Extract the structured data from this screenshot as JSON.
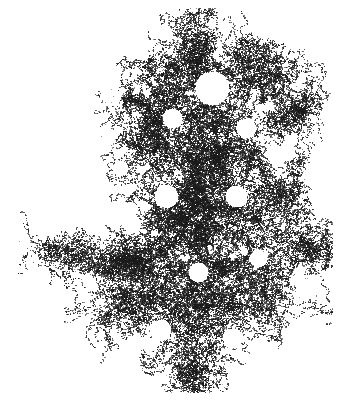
{
  "image": {
    "width": 354,
    "height": 405,
    "background_color": "#ffffff",
    "foreground_color": "#1a1a1a",
    "caption": ""
  },
  "chart_data": {
    "type": "scatter",
    "title": "",
    "subtitle": "",
    "xlabel": "",
    "ylabel": "",
    "xlim": [
      0,
      354
    ],
    "ylim": [
      0,
      405
    ],
    "grid": false,
    "legend": null,
    "axes_visible": false,
    "tick_labels_x": [],
    "tick_labels_y": [],
    "annotations": [],
    "marker": {
      "shape": "square",
      "size_px": 1,
      "color": "#1a1a1a",
      "opacity_range": [
        0.45,
        1.0
      ]
    },
    "point_count": 17000,
    "bounding_box": {
      "x_min": 18,
      "x_max": 332,
      "y_min": 8,
      "y_max": 392
    },
    "seed": 20240517,
    "structure": {
      "fractal_dimension": 1.72,
      "lobes": [
        {
          "name": "top-spur",
          "cx": 198,
          "cy": 22,
          "rx": 16,
          "ry": 16,
          "density": 0.55
        },
        {
          "name": "upper-crown",
          "cx": 196,
          "cy": 60,
          "rx": 44,
          "ry": 28,
          "density": 0.8
        },
        {
          "name": "upper-left-wing",
          "cx": 150,
          "cy": 92,
          "rx": 36,
          "ry": 30,
          "density": 0.78
        },
        {
          "name": "upper-right-wing",
          "cx": 252,
          "cy": 78,
          "rx": 40,
          "ry": 30,
          "density": 0.8
        },
        {
          "name": "right-horn",
          "cx": 292,
          "cy": 108,
          "rx": 28,
          "ry": 28,
          "density": 0.62
        },
        {
          "name": "mid-left-bulge",
          "cx": 134,
          "cy": 140,
          "rx": 32,
          "ry": 34,
          "density": 0.74
        },
        {
          "name": "core-upper",
          "cx": 200,
          "cy": 140,
          "rx": 56,
          "ry": 38,
          "density": 0.92
        },
        {
          "name": "core-center",
          "cx": 205,
          "cy": 190,
          "rx": 60,
          "ry": 42,
          "density": 0.95
        },
        {
          "name": "core-lower",
          "cx": 200,
          "cy": 240,
          "rx": 62,
          "ry": 40,
          "density": 0.92
        },
        {
          "name": "right-mid-lobe",
          "cx": 268,
          "cy": 185,
          "rx": 34,
          "ry": 38,
          "density": 0.78
        },
        {
          "name": "right-arm",
          "cx": 290,
          "cy": 252,
          "rx": 42,
          "ry": 24,
          "density": 0.7
        },
        {
          "name": "left-shoulder",
          "cx": 140,
          "cy": 262,
          "rx": 44,
          "ry": 26,
          "density": 0.8
        },
        {
          "name": "left-filament",
          "cx": 84,
          "cy": 258,
          "rx": 30,
          "ry": 13,
          "density": 0.55
        },
        {
          "name": "left-tip",
          "cx": 34,
          "cy": 252,
          "rx": 17,
          "ry": 15,
          "density": 0.6
        },
        {
          "name": "lower-left-foot",
          "cx": 124,
          "cy": 305,
          "rx": 34,
          "ry": 26,
          "density": 0.66
        },
        {
          "name": "lower-core",
          "cx": 205,
          "cy": 300,
          "rx": 56,
          "ry": 34,
          "density": 0.88
        },
        {
          "name": "lower-right-lobe",
          "cx": 262,
          "cy": 300,
          "rx": 34,
          "ry": 30,
          "density": 0.72
        },
        {
          "name": "bottom-pendant",
          "cx": 196,
          "cy": 352,
          "rx": 40,
          "ry": 30,
          "density": 0.74
        },
        {
          "name": "bottom-tail",
          "cx": 200,
          "cy": 382,
          "rx": 20,
          "ry": 12,
          "density": 0.5
        }
      ],
      "voids": [
        {
          "cx": 212,
          "cy": 88,
          "r": 17
        },
        {
          "cx": 172,
          "cy": 118,
          "r": 10
        },
        {
          "cx": 246,
          "cy": 128,
          "r": 10
        },
        {
          "cx": 166,
          "cy": 196,
          "r": 12
        },
        {
          "cx": 236,
          "cy": 196,
          "r": 11
        },
        {
          "cx": 132,
          "cy": 224,
          "r": 9
        },
        {
          "cx": 198,
          "cy": 272,
          "r": 10
        },
        {
          "cx": 258,
          "cy": 258,
          "r": 9
        },
        {
          "cx": 160,
          "cy": 330,
          "r": 11
        },
        {
          "cx": 232,
          "cy": 338,
          "r": 10
        },
        {
          "cx": 120,
          "cy": 168,
          "r": 8
        },
        {
          "cx": 286,
          "cy": 152,
          "r": 9
        }
      ],
      "filaments": [
        {
          "from": [
            48,
            250
          ],
          "to": [
            108,
            262
          ],
          "width": 9,
          "density": 0.55
        },
        {
          "from": [
            108,
            262
          ],
          "to": [
            152,
            268
          ],
          "width": 14,
          "density": 0.7
        },
        {
          "from": [
            300,
            250
          ],
          "to": [
            330,
            246
          ],
          "width": 10,
          "density": 0.5
        },
        {
          "from": [
            196,
            32
          ],
          "to": [
            198,
            70
          ],
          "width": 12,
          "density": 0.6
        },
        {
          "from": [
            190,
            366
          ],
          "to": [
            200,
            390
          ],
          "width": 12,
          "density": 0.48
        },
        {
          "from": [
            276,
            118
          ],
          "to": [
            308,
            104
          ],
          "width": 12,
          "density": 0.55
        },
        {
          "from": [
            120,
            296
          ],
          "to": [
            146,
            320
          ],
          "width": 11,
          "density": 0.55
        }
      ]
    }
  }
}
